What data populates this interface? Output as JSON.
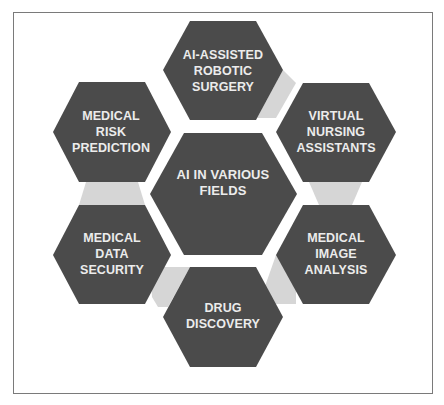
{
  "diagram": {
    "title": "AI IN VARIOUS FIELDS",
    "colors": {
      "hexagon_fill": "#4b4b4b",
      "text": "#ececec",
      "connector": "#d6d6d6",
      "frame_border": "#7a7a7a",
      "background": "#ffffff"
    },
    "center": {
      "lines": [
        "AI IN VARIOUS",
        "FIELDS"
      ]
    },
    "nodes": [
      {
        "id": "top",
        "lines": [
          "AI-ASSISTED",
          "ROBOTIC",
          "SURGERY"
        ]
      },
      {
        "id": "top-right",
        "lines": [
          "VIRTUAL",
          "NURSING",
          "ASSISTANTS"
        ]
      },
      {
        "id": "bottom-right",
        "lines": [
          "MEDICAL",
          "IMAGE",
          "ANALYSIS"
        ]
      },
      {
        "id": "bottom",
        "lines": [
          "DRUG",
          "DISCOVERY"
        ]
      },
      {
        "id": "bottom-left",
        "lines": [
          "MEDICAL",
          "DATA",
          "SECURITY"
        ]
      },
      {
        "id": "top-left",
        "lines": [
          "MEDICAL",
          "RISK",
          "PREDICTION"
        ]
      }
    ]
  }
}
